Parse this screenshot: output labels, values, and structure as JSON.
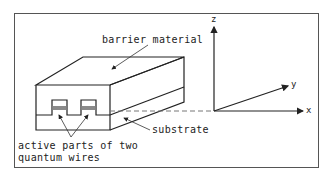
{
  "diagram": {
    "labels": {
      "barrier": "barrier material",
      "substrate": "substrate",
      "active_line1": "active parts of two",
      "active_line2": "quantum wires"
    },
    "axes": {
      "z": "z",
      "y": "y",
      "x": "x"
    },
    "colors": {
      "line": "#222222",
      "frame": "#555555",
      "active_band": "#8a8a8a",
      "dashed": "#777777"
    }
  }
}
